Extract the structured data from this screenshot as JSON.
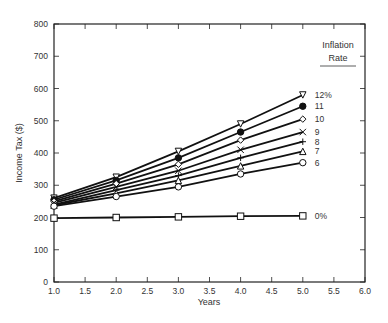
{
  "chart_data": {
    "type": "line",
    "title": "",
    "xlabel": "Years",
    "ylabel": "Income Tax ($)",
    "xlim": [
      1.0,
      6.0
    ],
    "ylim": [
      0,
      800
    ],
    "x_ticks": [
      "1.0",
      "1.5",
      "2.0",
      "2.5",
      "3.0",
      "3.5",
      "4.0",
      "4.5",
      "5.0",
      "5.5",
      "6.0"
    ],
    "y_ticks": [
      "0",
      "100",
      "200",
      "300",
      "400",
      "500",
      "600",
      "700",
      "800"
    ],
    "grid": false,
    "legend_title": [
      "Inflation",
      "Rate"
    ],
    "x": [
      1,
      2,
      3,
      4,
      5
    ],
    "series": [
      {
        "name": "12%",
        "marker": "triangle-down-open",
        "values": [
          260,
          325,
          405,
          490,
          580
        ]
      },
      {
        "name": "11",
        "marker": "circle-filled",
        "values": [
          255,
          315,
          385,
          465,
          545
        ]
      },
      {
        "name": "10",
        "marker": "diamond-open",
        "values": [
          250,
          305,
          365,
          440,
          505
        ]
      },
      {
        "name": "9",
        "marker": "x",
        "values": [
          245,
          295,
          345,
          410,
          465
        ]
      },
      {
        "name": "8",
        "marker": "plus",
        "values": [
          240,
          285,
          330,
          385,
          435
        ]
      },
      {
        "name": "7",
        "marker": "triangle-up-open",
        "values": [
          238,
          275,
          315,
          360,
          405
        ]
      },
      {
        "name": "6",
        "marker": "circle-open",
        "values": [
          235,
          265,
          295,
          335,
          370
        ]
      },
      {
        "name": "0%",
        "marker": "square-open",
        "values": [
          198,
          200,
          202,
          204,
          205
        ]
      }
    ],
    "annotations": "Series labels placed at right end of each line"
  }
}
